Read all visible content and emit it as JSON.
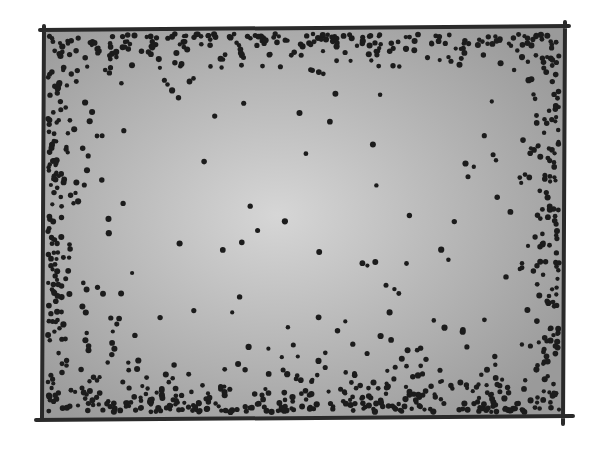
{
  "illustration": {
    "subject": "hand-drawn rectangle with dots clustered along the edges",
    "frame": {
      "x1": 42,
      "y1": 28,
      "x2": 565,
      "y2": 418,
      "stroke": "#2a2a2a",
      "stroke_width": 4
    },
    "fill": {
      "center": "#d6d6d6",
      "edge": "#9a9a9a"
    },
    "dots": {
      "color": "#1c1c1c",
      "radius": 2.6,
      "edge_count": 900,
      "interior_count": 60,
      "seed": 7
    }
  }
}
